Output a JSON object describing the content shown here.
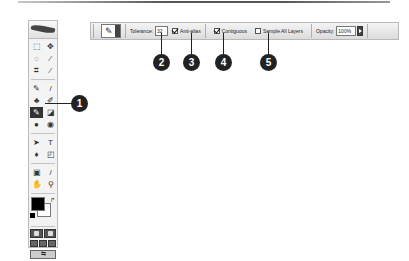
{
  "options_bar": {
    "tool_preset_glyph": "✎",
    "tolerance_label": "Tolerance:",
    "tolerance_value": "32",
    "anti_alias": {
      "label": "Anti-alias",
      "checked": true
    },
    "contiguous": {
      "label": "Contiguous",
      "checked": true
    },
    "sample_all_layers": {
      "label": "Sample All Layers",
      "checked": false
    },
    "opacity_label": "Opacity:",
    "opacity_value": "100%"
  },
  "toolbox": {
    "tools": [
      {
        "name": "marquee",
        "glyph": "⬚"
      },
      {
        "name": "move",
        "glyph": "✥"
      },
      {
        "name": "lasso",
        "glyph": "◌"
      },
      {
        "name": "magic-wand",
        "glyph": "⁄"
      },
      {
        "name": "crop",
        "glyph": "⌗"
      },
      {
        "name": "slice",
        "glyph": "⁄"
      },
      {
        "name": "healing-brush",
        "glyph": "✎"
      },
      {
        "name": "brush",
        "glyph": "/"
      },
      {
        "name": "clone-stamp",
        "glyph": "♣"
      },
      {
        "name": "history-brush",
        "glyph": "✐"
      },
      {
        "name": "eraser",
        "glyph": "✎",
        "active": true
      },
      {
        "name": "gradient",
        "glyph": "◪"
      },
      {
        "name": "blur",
        "glyph": "●"
      },
      {
        "name": "dodge",
        "glyph": "◉"
      },
      {
        "name": "path-selection",
        "glyph": "➤"
      },
      {
        "name": "type",
        "glyph": "T"
      },
      {
        "name": "pen",
        "glyph": "♦"
      },
      {
        "name": "shape",
        "glyph": "◰"
      },
      {
        "name": "notes",
        "glyph": "▣"
      },
      {
        "name": "eyedropper",
        "glyph": "/"
      },
      {
        "name": "hand",
        "glyph": "✋"
      },
      {
        "name": "zoom",
        "glyph": "⚲"
      }
    ],
    "swap_glyph": "↱",
    "jump_glyph": "⇆"
  },
  "callouts": [
    {
      "number": "1"
    },
    {
      "number": "2"
    },
    {
      "number": "3"
    },
    {
      "number": "4"
    },
    {
      "number": "5"
    }
  ]
}
